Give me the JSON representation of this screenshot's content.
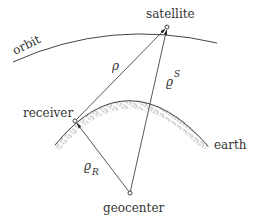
{
  "diagram": {
    "title": "",
    "labels": {
      "orbit": "orbit",
      "satellite": "satellite",
      "receiver": "receiver",
      "earth": "earth",
      "geocenter": "geocenter"
    },
    "symbols": {
      "rho": "ρ",
      "rho_s_base": "ϱ",
      "rho_s_sup": "S",
      "rho_r_base": "ϱ",
      "rho_r_sub": "R"
    },
    "nodes": [
      {
        "id": "satellite",
        "x": 167,
        "y": 27
      },
      {
        "id": "receiver",
        "x": 75,
        "y": 121
      },
      {
        "id": "geocenter",
        "x": 130,
        "y": 193
      }
    ],
    "edges": [
      {
        "from": "receiver",
        "to": "satellite",
        "label": "ρ",
        "arrow": "end"
      },
      {
        "from": "geocenter",
        "to": "satellite",
        "label": "ϱ^S",
        "arrow": "end"
      },
      {
        "from": "geocenter",
        "to": "receiver",
        "label": "ϱ_R",
        "arrow": "end"
      }
    ],
    "colors": {
      "line": "#444444",
      "hatch": "#9a9a9a",
      "text": "#333333",
      "background": "#ffffff"
    }
  }
}
